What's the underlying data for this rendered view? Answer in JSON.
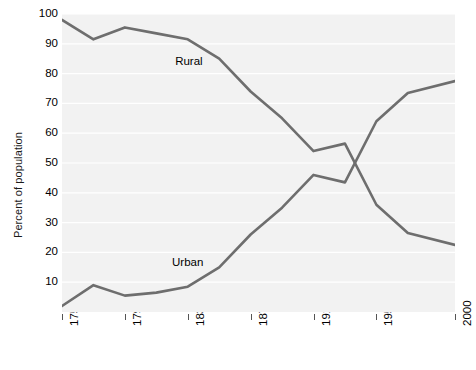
{
  "chart_data": {
    "type": "line",
    "title": "",
    "xlabel": "",
    "ylabel": "Percent of population",
    "xlim": [
      1750,
      2000
    ],
    "ylim": [
      0,
      100
    ],
    "xticks": [
      1750,
      1790,
      1830,
      1870,
      1910,
      1950,
      2000
    ],
    "yticks": [
      10,
      20,
      30,
      40,
      50,
      60,
      70,
      80,
      90,
      100
    ],
    "grid": true,
    "legend_position": "inline-annotation",
    "x": [
      1750,
      1770,
      1790,
      1810,
      1830,
      1850,
      1870,
      1890,
      1910,
      1930,
      1950,
      1970,
      2000
    ],
    "series": [
      {
        "name": "Rural",
        "color": "#6e6e6e",
        "values": [
          98,
          91.5,
          95.5,
          93.5,
          91.5,
          85,
          74,
          65,
          54,
          56.5,
          36,
          26.5,
          22.5
        ]
      },
      {
        "name": "Urban",
        "color": "#6e6e6e",
        "values": [
          2,
          9,
          5.5,
          6.5,
          8.5,
          15,
          26,
          35,
          46,
          43.5,
          64,
          73.5,
          77.5
        ]
      }
    ],
    "annotations": [
      {
        "text": "Rural",
        "x": 1822,
        "y": 84
      },
      {
        "text": "Urban",
        "x": 1820,
        "y": 16.5
      }
    ]
  },
  "caption": {
    "text": ""
  }
}
